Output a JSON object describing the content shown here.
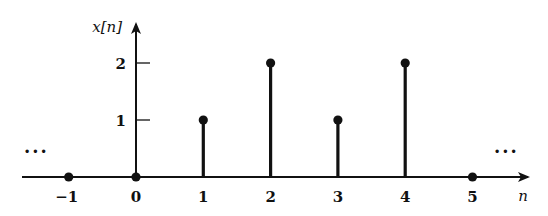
{
  "chart_data": {
    "type": "stem",
    "title": "",
    "xlabel": "n",
    "ylabel": "x[n]",
    "x": [
      -1,
      0,
      1,
      2,
      3,
      4,
      5
    ],
    "values": [
      0,
      0,
      1,
      2,
      1,
      2,
      0
    ],
    "x_tick_labels": [
      "−1",
      "0",
      "1",
      "2",
      "3",
      "4",
      "5"
    ],
    "y_tick_labels": [
      "1",
      "2"
    ],
    "y_ticks": [
      1,
      2
    ],
    "ylim": [
      0,
      2.5
    ],
    "xlim": [
      -1.7,
      5.8
    ],
    "grid": false,
    "legend": null,
    "annotations": {
      "left_continuation": "···",
      "right_continuation": "···"
    }
  },
  "colors": {
    "ink": "#111111",
    "background": "#ffffff"
  }
}
